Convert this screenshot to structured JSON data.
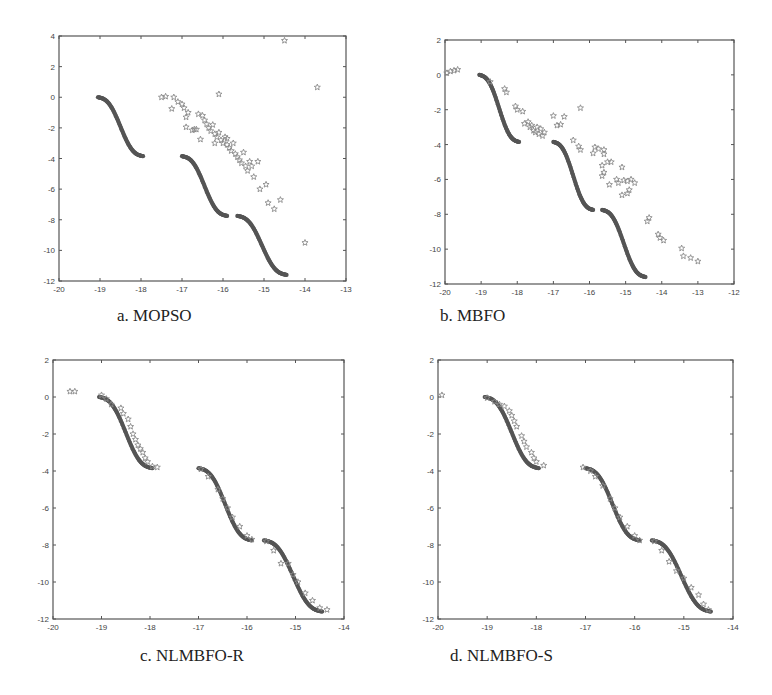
{
  "figure": {
    "background": "#ffffff",
    "front_color": "#555555",
    "star_color": "#8a8a8a",
    "axis_color": "#555555"
  },
  "panels": [
    {
      "id": "a",
      "caption": "a. MOPSO",
      "frame": {
        "left": 59,
        "top": 36,
        "right": 346,
        "bottom": 281
      },
      "caption_pos": {
        "left": 117,
        "top": 306
      },
      "xlim": [
        -20,
        -13
      ],
      "ylim": [
        -12,
        4
      ],
      "xticks": [
        -20,
        -19,
        -18,
        -17,
        -16,
        -15,
        -14,
        -13
      ],
      "yticks": [
        4,
        2,
        0,
        -2,
        -4,
        -6,
        -8,
        -10,
        -12
      ]
    },
    {
      "id": "b",
      "caption": "b. MBFO",
      "frame": {
        "left": 445,
        "top": 40,
        "right": 734,
        "bottom": 284
      },
      "caption_pos": {
        "left": 440,
        "top": 306
      },
      "xlim": [
        -20,
        -12
      ],
      "ylim": [
        -12,
        2
      ],
      "xticks": [
        -20,
        -19,
        -18,
        -17,
        -16,
        -15,
        -14,
        -13,
        -12
      ],
      "yticks": [
        2,
        0,
        -2,
        -4,
        -6,
        -8,
        -10,
        -12
      ]
    },
    {
      "id": "c",
      "caption": "c. NLMBFO-R",
      "frame": {
        "left": 53,
        "top": 360,
        "right": 344,
        "bottom": 619
      },
      "caption_pos": {
        "left": 140,
        "top": 646
      },
      "xlim": [
        -20,
        -14
      ],
      "ylim": [
        -12,
        2
      ],
      "xticks": [
        -20,
        -19,
        -18,
        -17,
        -16,
        -15,
        -14
      ],
      "yticks": [
        2,
        0,
        -2,
        -4,
        -6,
        -8,
        -10,
        -12
      ]
    },
    {
      "id": "d",
      "caption": "d. NLMBFO-S",
      "frame": {
        "left": 438,
        "top": 360,
        "right": 733,
        "bottom": 619
      },
      "caption_pos": {
        "left": 450,
        "top": 646
      },
      "xlim": [
        -20,
        -14
      ],
      "ylim": [
        -12,
        2
      ],
      "xticks": [
        -20,
        -19,
        -18,
        -17,
        -16,
        -15,
        -14
      ],
      "yticks": [
        2,
        0,
        -2,
        -4,
        -6,
        -8,
        -10,
        -12
      ]
    }
  ],
  "chart_data": [
    {
      "type": "scatter",
      "title": "a. MOPSO",
      "xlabel": "",
      "ylabel": "",
      "xlim": [
        -20,
        -13
      ],
      "ylim": [
        -12,
        4
      ],
      "grid": false,
      "legend": null,
      "series": [
        {
          "name": "True Pareto front",
          "marker": "dot",
          "segments": [
            {
              "x": [
                -19.05,
                -17.95
              ],
              "y": [
                0,
                -3.85
              ]
            },
            {
              "x": [
                -17.0,
                -15.9
              ],
              "y": [
                -3.85,
                -7.75
              ]
            },
            {
              "x": [
                -15.65,
                -14.45
              ],
              "y": [
                -7.75,
                -11.6
              ]
            }
          ]
        },
        {
          "name": "MOPSO solutions",
          "marker": "star",
          "points": [
            [
              -17.5,
              0.0
            ],
            [
              -17.4,
              0.05
            ],
            [
              -17.2,
              0.0
            ],
            [
              -17.25,
              -0.75
            ],
            [
              -17.1,
              -0.3
            ],
            [
              -17.0,
              -0.45
            ],
            [
              -16.95,
              -0.7
            ],
            [
              -16.85,
              -1.0
            ],
            [
              -16.9,
              -1.3
            ],
            [
              -16.9,
              -1.95
            ],
            [
              -16.75,
              -2.15
            ],
            [
              -16.65,
              -2.1
            ],
            [
              -16.55,
              -2.75
            ],
            [
              -16.5,
              -1.2
            ],
            [
              -16.45,
              -1.5
            ],
            [
              -16.4,
              -1.75
            ],
            [
              -16.35,
              -2.0
            ],
            [
              -16.3,
              -2.2
            ],
            [
              -16.25,
              -1.8
            ],
            [
              -16.2,
              -2.4
            ],
            [
              -16.15,
              -2.6
            ],
            [
              -16.1,
              -2.3
            ],
            [
              -16.05,
              -2.8
            ],
            [
              -16.0,
              -3.0
            ],
            [
              -15.95,
              -2.6
            ],
            [
              -15.9,
              -3.1
            ],
            [
              -15.85,
              -3.3
            ],
            [
              -15.8,
              -3.5
            ],
            [
              -15.75,
              -3.0
            ],
            [
              -15.7,
              -3.7
            ],
            [
              -15.65,
              -3.9
            ],
            [
              -15.6,
              -4.1
            ],
            [
              -15.55,
              -4.3
            ],
            [
              -15.5,
              -3.6
            ],
            [
              -15.45,
              -4.5
            ],
            [
              -15.4,
              -4.8
            ],
            [
              -15.35,
              -4.2
            ],
            [
              -15.3,
              -4.5
            ],
            [
              -15.25,
              -5.2
            ],
            [
              -15.15,
              -4.2
            ],
            [
              -15.1,
              -6.0
            ],
            [
              -14.95,
              -5.7
            ],
            [
              -14.9,
              -6.9
            ],
            [
              -14.75,
              -7.3
            ],
            [
              -14.6,
              -6.7
            ],
            [
              -16.1,
              0.2
            ],
            [
              -14.5,
              3.7
            ],
            [
              -13.7,
              0.65
            ],
            [
              -14.0,
              -9.5
            ],
            [
              -16.7,
              -2.1
            ],
            [
              -16.6,
              -1.1
            ],
            [
              -16.2,
              -3.0
            ],
            [
              -15.9,
              -2.7
            ]
          ]
        }
      ]
    },
    {
      "type": "scatter",
      "title": "b. MBFO",
      "xlabel": "",
      "ylabel": "",
      "xlim": [
        -20,
        -12
      ],
      "ylim": [
        -12,
        2
      ],
      "grid": false,
      "legend": null,
      "series": [
        {
          "name": "True Pareto front",
          "marker": "dot",
          "segments": [
            {
              "x": [
                -19.05,
                -17.95
              ],
              "y": [
                0,
                -3.85
              ]
            },
            {
              "x": [
                -17.0,
                -15.9
              ],
              "y": [
                -3.85,
                -7.75
              ]
            },
            {
              "x": [
                -15.65,
                -14.45
              ],
              "y": [
                -7.75,
                -11.6
              ]
            }
          ]
        },
        {
          "name": "MBFO solutions",
          "marker": "star",
          "points": [
            [
              -19.95,
              0.1
            ],
            [
              -19.85,
              0.2
            ],
            [
              -19.75,
              0.25
            ],
            [
              -19.65,
              0.3
            ],
            [
              -18.75,
              -0.4
            ],
            [
              -18.35,
              -0.8
            ],
            [
              -18.3,
              -1.0
            ],
            [
              -18.05,
              -1.8
            ],
            [
              -18.0,
              -2.0
            ],
            [
              -17.85,
              -2.1
            ],
            [
              -17.8,
              -2.8
            ],
            [
              -17.7,
              -2.7
            ],
            [
              -17.65,
              -3.0
            ],
            [
              -17.6,
              -2.9
            ],
            [
              -17.55,
              -3.2
            ],
            [
              -17.5,
              -3.3
            ],
            [
              -17.45,
              -3.0
            ],
            [
              -17.4,
              -3.4
            ],
            [
              -17.35,
              -3.1
            ],
            [
              -17.3,
              -3.5
            ],
            [
              -17.25,
              -3.3
            ],
            [
              -17.0,
              -2.35
            ],
            [
              -16.9,
              -2.9
            ],
            [
              -16.8,
              -2.85
            ],
            [
              -16.7,
              -2.4
            ],
            [
              -16.25,
              -1.9
            ],
            [
              -16.45,
              -3.75
            ],
            [
              -16.3,
              -4.1
            ],
            [
              -16.25,
              -4.3
            ],
            [
              -15.85,
              -4.15
            ],
            [
              -15.75,
              -4.25
            ],
            [
              -15.6,
              -4.3
            ],
            [
              -15.6,
              -4.55
            ],
            [
              -15.9,
              -4.5
            ],
            [
              -15.65,
              -5.2
            ],
            [
              -15.5,
              -5.0
            ],
            [
              -15.4,
              -5.0
            ],
            [
              -15.6,
              -5.6
            ],
            [
              -15.65,
              -5.8
            ],
            [
              -15.45,
              -6.3
            ],
            [
              -15.25,
              -6.0
            ],
            [
              -15.2,
              -6.2
            ],
            [
              -15.05,
              -6.05
            ],
            [
              -14.95,
              -6.1
            ],
            [
              -14.85,
              -6.0
            ],
            [
              -14.75,
              -6.2
            ],
            [
              -15.1,
              -5.3
            ],
            [
              -15.1,
              -6.9
            ],
            [
              -14.95,
              -6.8
            ],
            [
              -14.9,
              -6.6
            ],
            [
              -14.35,
              -8.2
            ],
            [
              -14.4,
              -8.4
            ],
            [
              -14.1,
              -9.15
            ],
            [
              -14.05,
              -9.35
            ],
            [
              -13.95,
              -9.5
            ],
            [
              -13.45,
              -9.95
            ],
            [
              -13.4,
              -10.4
            ],
            [
              -13.2,
              -10.5
            ],
            [
              -13.0,
              -10.7
            ]
          ]
        }
      ]
    },
    {
      "type": "scatter",
      "title": "c. NLMBFO-R",
      "xlabel": "",
      "ylabel": "",
      "xlim": [
        -20,
        -14
      ],
      "ylim": [
        -12,
        2
      ],
      "grid": false,
      "legend": null,
      "series": [
        {
          "name": "True Pareto front",
          "marker": "dot",
          "segments": [
            {
              "x": [
                -19.05,
                -17.95
              ],
              "y": [
                0,
                -3.85
              ]
            },
            {
              "x": [
                -17.0,
                -15.9
              ],
              "y": [
                -3.85,
                -7.75
              ]
            },
            {
              "x": [
                -15.65,
                -14.45
              ],
              "y": [
                -7.75,
                -11.6
              ]
            }
          ]
        },
        {
          "name": "NLMBFO-R solutions",
          "marker": "star",
          "points": [
            [
              -19.65,
              0.3
            ],
            [
              -19.55,
              0.3
            ],
            [
              -19.0,
              0.1
            ],
            [
              -18.9,
              -0.1
            ],
            [
              -18.8,
              -0.4
            ],
            [
              -18.6,
              -0.6
            ],
            [
              -18.55,
              -0.9
            ],
            [
              -18.45,
              -1.2
            ],
            [
              -18.4,
              -1.6
            ],
            [
              -18.35,
              -2.0
            ],
            [
              -18.3,
              -2.3
            ],
            [
              -18.25,
              -2.6
            ],
            [
              -18.2,
              -2.8
            ],
            [
              -18.15,
              -3.0
            ],
            [
              -18.1,
              -3.3
            ],
            [
              -18.05,
              -3.5
            ],
            [
              -17.95,
              -3.75
            ],
            [
              -17.85,
              -3.8
            ],
            [
              -16.95,
              -3.9
            ],
            [
              -16.8,
              -4.3
            ],
            [
              -16.6,
              -5.0
            ],
            [
              -16.5,
              -5.5
            ],
            [
              -16.4,
              -6.0
            ],
            [
              -16.3,
              -6.5
            ],
            [
              -16.15,
              -7.0
            ],
            [
              -16.0,
              -7.5
            ],
            [
              -15.9,
              -7.7
            ],
            [
              -15.6,
              -7.8
            ],
            [
              -15.45,
              -8.3
            ],
            [
              -15.3,
              -9.0
            ],
            [
              -15.15,
              -9.0
            ],
            [
              -15.05,
              -9.6
            ],
            [
              -14.95,
              -10.0
            ],
            [
              -14.8,
              -10.6
            ],
            [
              -14.65,
              -11.0
            ],
            [
              -14.5,
              -11.4
            ],
            [
              -14.35,
              -11.5
            ]
          ]
        }
      ]
    },
    {
      "type": "scatter",
      "title": "d. NLMBFO-S",
      "xlabel": "",
      "ylabel": "",
      "xlim": [
        -20,
        -14
      ],
      "ylim": [
        -12,
        2
      ],
      "grid": false,
      "legend": null,
      "series": [
        {
          "name": "True Pareto front",
          "marker": "dot",
          "segments": [
            {
              "x": [
                -19.05,
                -17.95
              ],
              "y": [
                0,
                -3.85
              ]
            },
            {
              "x": [
                -17.0,
                -15.9
              ],
              "y": [
                -3.85,
                -7.75
              ]
            },
            {
              "x": [
                -15.65,
                -14.45
              ],
              "y": [
                -7.75,
                -11.6
              ]
            }
          ]
        },
        {
          "name": "NLMBFO-S solutions",
          "marker": "star",
          "points": [
            [
              -19.92,
              0.1
            ],
            [
              -19.0,
              -0.05
            ],
            [
              -18.85,
              -0.25
            ],
            [
              -18.75,
              -0.4
            ],
            [
              -18.65,
              -0.5
            ],
            [
              -18.55,
              -0.75
            ],
            [
              -18.5,
              -1.0
            ],
            [
              -18.45,
              -1.3
            ],
            [
              -18.4,
              -1.6
            ],
            [
              -18.3,
              -2.1
            ],
            [
              -18.25,
              -2.4
            ],
            [
              -18.2,
              -2.7
            ],
            [
              -18.1,
              -3.0
            ],
            [
              -18.05,
              -3.3
            ],
            [
              -18.0,
              -3.5
            ],
            [
              -17.85,
              -3.7
            ],
            [
              -17.05,
              -3.8
            ],
            [
              -16.9,
              -4.0
            ],
            [
              -16.8,
              -4.3
            ],
            [
              -16.65,
              -4.8
            ],
            [
              -16.5,
              -5.5
            ],
            [
              -16.4,
              -6.0
            ],
            [
              -16.3,
              -6.5
            ],
            [
              -16.15,
              -7.0
            ],
            [
              -16.0,
              -7.5
            ],
            [
              -15.9,
              -7.75
            ],
            [
              -15.6,
              -7.8
            ],
            [
              -15.45,
              -8.3
            ],
            [
              -15.3,
              -8.9
            ],
            [
              -15.15,
              -9.4
            ],
            [
              -15.0,
              -9.8
            ],
            [
              -14.85,
              -10.3
            ],
            [
              -14.7,
              -10.7
            ],
            [
              -14.6,
              -11.2
            ],
            [
              -14.5,
              -11.5
            ]
          ]
        }
      ]
    }
  ]
}
